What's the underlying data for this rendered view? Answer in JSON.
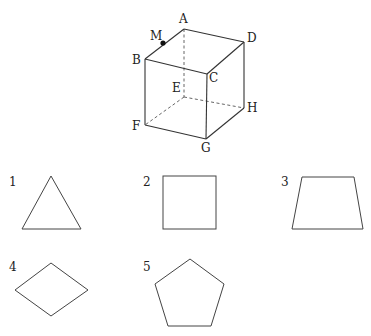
{
  "cube": {
    "vertices": {
      "A": {
        "label": "A",
        "x": 184,
        "y": 29
      },
      "B": {
        "label": "B",
        "x": 145,
        "y": 59
      },
      "C": {
        "label": "C",
        "x": 207,
        "y": 74
      },
      "D": {
        "label": "D",
        "x": 244,
        "y": 42
      },
      "E": {
        "label": "E",
        "x": 184,
        "y": 97
      },
      "F": {
        "label": "F",
        "x": 145,
        "y": 125
      },
      "G": {
        "label": "G",
        "x": 206,
        "y": 139
      },
      "H": {
        "label": "H",
        "x": 244,
        "y": 108
      }
    },
    "point_M": {
      "label": "M",
      "x": 163,
      "y": 43,
      "on_edge": "AB"
    },
    "hidden_edges": [
      "AE",
      "EF",
      "EH"
    ]
  },
  "options": [
    {
      "number": "1",
      "shape": "triangle"
    },
    {
      "number": "2",
      "shape": "square"
    },
    {
      "number": "3",
      "shape": "trapezoid"
    },
    {
      "number": "4",
      "shape": "rhombus"
    },
    {
      "number": "5",
      "shape": "pentagon"
    }
  ]
}
